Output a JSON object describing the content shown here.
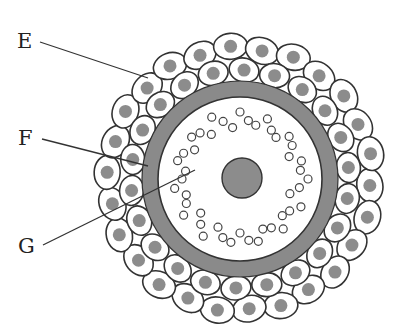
{
  "figure": {
    "type": "biology-diagram",
    "colors": {
      "background": "#ffffff",
      "outline": "#333333",
      "gray_fill": "#8a8a8a",
      "cell_fill": "#ffffff",
      "nucleus_fill": "#8c8c8c",
      "granule_stroke": "#444444"
    },
    "labels": [
      {
        "id": "E",
        "text": "E",
        "pointer_from": [
          40,
          42
        ],
        "pointer_to": [
          148,
          78
        ]
      },
      {
        "id": "F",
        "text": "F",
        "pointer_from": [
          42,
          139
        ],
        "pointer_to": [
          148,
          166
        ]
      },
      {
        "id": "G",
        "text": "G",
        "pointer_from": [
          43,
          245
        ],
        "pointer_to": [
          195,
          170
        ]
      }
    ],
    "geometry": {
      "center": [
        240,
        179
      ],
      "inner_circle_radius": 82,
      "gray_ring_outer_radius": 98,
      "nucleus_center": [
        242,
        178
      ],
      "nucleus_radius": 20,
      "cell_layer_inner_radius": 98,
      "cell_layer_outer_radius": 142
    }
  }
}
